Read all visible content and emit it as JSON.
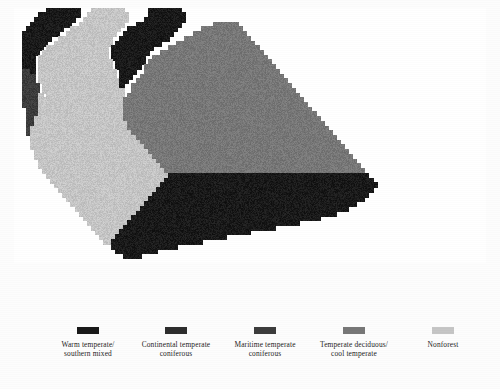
{
  "figure": {
    "kind": "raster-map",
    "region": "United States",
    "background_color": "#fdfdfd"
  },
  "chart_data": {
    "type": "heatmap",
    "title": "",
    "subtitle": "",
    "xlabel": "",
    "ylabel": "",
    "grid": false,
    "legend_position": "bottom",
    "classes": [
      {
        "id": "warm_temperate_southern_mixed",
        "label": "Warm temperate/\nsouthern mixed",
        "color": "#1a1a1a",
        "code": 1
      },
      {
        "id": "continental_temperate_coniferous",
        "label": "Continental temperate\nconiferous",
        "color": "#2e2e2e",
        "code": 2
      },
      {
        "id": "maritime_temperate_coniferous",
        "label": "Maritime temperate\nconiferous",
        "color": "#3d3d3d",
        "code": 3
      },
      {
        "id": "temperate_deciduous_cool_temperate",
        "label": "Temperate deciduous/\ncool temperate",
        "color": "#787878",
        "code": 4
      },
      {
        "id": "nonforest",
        "label": "Nonforest",
        "color": "#c6c6c6",
        "code": 5
      }
    ],
    "nodata_color": "#ffffff",
    "grid_cols": 118,
    "grid_rows": 64,
    "cell_px": 4,
    "values_note": "Each string row encodes one raster row; characters 0-5 map to class codes, 0 = background/no data (white ocean or outside USA).",
    "rows": [
      "00000000111111110005555555500000011111111000000000000000000000000000000000000000000000000000000000000000000000000000",
      "00000011111111110055555555550000011111111100000000000000000000000000000000000000000000000000000000000000000000000000",
      "00000111111111100555555555550000111111111100000000000000000000000000000000000000000000000000000000000000000000000000",
      "00001111111111005555555555500011111111111000000004444440000000000000000000000000000000000000000000000000000000000000",
      "00011111111100555555555555001111111111110000004444444444000000000000000000000000000000000000000000000000000000000000",
      "00111111111005555555555550011111111111100000444444444444400000000000000000000000000000000000000000000000000000000000",
      "00111111100555555555555500111111111111000044444444444444440000000000000000000000000000000000000000000000000000000000",
      "00111111005555555555555501111111111100004444444444444444444000000000000000000000000000000000000000000000000000000000",
      "00111110555555555555555011111111110000444444444444444444444400000000000000000000000000000000000000000000000000000000",
      "00111105555555555555555011111111100044444444444444444444444440000000000000000000000000000000000000000000000000000000",
      "00111055555555555555555011111111004444444444444444444444444444000000000000000000000000000000000000000000000000000000",
      "00111055555555555555555501111111044444444444444444444444444444400000000000000000000000000000000000000000000000000000",
      "00111055555555555555555501111110444444444444444444444444444444440000000000000000000000000000000000000000000000000000",
      "00331055555555555555555550111100444444444444444444444444444444444000000000000000000000000000000000000000000000000000",
      "00333055555555555555555550111004444444444444444444444444444444444400000000000000000000000000000000000000000000000000",
      "00333055555555555555555555110044444444444444444444444444444444444440000000000000000000000000000000000000000000000000",
      "00333305555555555555555555100444444444444444444444444444444444444444000000000000000000000000000000000000000000000000",
      "00333305555555555555555555500444444444444444444444444444444444444444400000000000000000000000000000000000000000000000",
      "00333350555555555555555555504444444444444444444444444444444444444444440000000000000000000000000000000000000000000000",
      "00333355555555555555555555544444444444444444444444444444444444444444444000000000000000000000000000000000000000000000",
      "00333355555555555555555555544444444444444444444444444444444444444444444400000000000000000000000000000000000000000000",
      "00033355555555555555555555544444444444444444444444444444444444444444444440000000000000000000000000000000000000000000",
      "00033355555555555555555555544444444444444444444444444444444444444444444444000000000000000000000000000000000000000000",
      "00033555555555555555555555544444444444444444444444444444444444444444444444400000000000000000000000000000000000000000",
      "00033555555555555555555555554444444444444444444444444444444444444444444444440000000000000000000000000000000000000000",
      "00035555555555555555555555554444444444444444444444444444444444444444444444444000000000000000000000000000000000000000",
      "00035555555555555555555555555444444444444444444444444444444444444444444444444400000000000000000000000000000000000000",
      "00005555555555555555555555555544444444444444444444444444444444444444444444444440000000000000000000000000000000000000",
      "00005555555555555555555555555554444444444444444444444444444444444444444444444444000000000000000000000000000000000000",
      "00005555555555555555555555555555444444444444444444444444444444444444444444444444400000000000000000000000000000000000",
      "00000555555555555555555555555555544444444444444444444444444444444444444444444444440000000000000000000000000000000000",
      "00000555555555555555555555555555554444444444444444444444444444444444444444444444444000000000000000000000000000000000",
      "00000055555555555555555555555555555444444444444444444444444444444444444444444444444400000000000000000000000000000000",
      "00000055555555555555555555555555555544444444444444444444444444444444444444444444444440000000000000000000000000000000",
      "00000005555555555555555555555555555554444444444444444444444444444444444444444444444444000000000000000000000000000000",
      "00000000555555555555555555555555555555111111111111111111111111111111111111111111111111100000000000000000000000000000",
      "00000000055555555555555555555555555551111111111111111111111111111111111111111111111111110000000000000000000000000000",
      "00000000005555555555555555555555555511111111111111111111111111111111111111111111111111111000000000000000000000000000",
      "00000000000555555555555555555555555111111111111111111111111111111111111111111111111111110000000000000000000000000000",
      "00000000000055555555555555555555551111111111111111111111111111111111111111111111111111100000000000000000000000000000",
      "00000000000005555555555555555555511111111111111111111111111111111111111111111111111111000000000000000000000000000000",
      "00000000000000555555555555555555111111111111111111111111111111111111111111111111111100000000000000000000000000000000",
      "00000000000000055555555555555551111111111111111111111111111111111111111111111111110000000000000000000000000000000000",
      "00000000000000005555555555555511111111111111111111111111111111111111111111111110000000000000000000000000000000000000",
      "00000000000000000555555555555111111111111111111111111111111111111111111111100000000000000000000000000000000000000000",
      "00000000000000000055555555551111111111111111111111111111111111111111110000000000000000000000000000000000000000000000",
      "00000000000000000005555555511111111111111111111111111111111111110000000000000000000000000000000000000000000000000000",
      "00000000000000000000555555111111111111111111111111111111110000000000000000000000000000000000000000000000000000000000",
      "00000000000000000000055551111111111111111111111111110000000000000000000000000000000000000000000000000000000000000000",
      "00000000000000000000005511111111111111111111110000000000000000000000000000000000000000000000000000000000000000000000",
      "00000000000000000000000011111111111111110000000000000000000000000000000000000000000000000000000000000000000000000000",
      "00000000000000000000000001111111111000000000000000000000000000000000000000000000000000000000000000000000000000000000",
      "00000000000000000000000000011110000000000000000000000000000000000000000000000000000000000000000000000000000000000000",
      "00000000000000000000000000000000000000000000000000000000000000000000000000000000000000000000000000000000000000000000"
    ]
  },
  "legend": {
    "items": [
      {
        "label": "Warm temperate/\nsouthern mixed",
        "color": "#1a1a1a"
      },
      {
        "label": "Continental temperate\nconiferous",
        "color": "#2e2e2e"
      },
      {
        "label": "Maritime temperate\nconiferous",
        "color": "#3d3d3d"
      },
      {
        "label": "Temperate deciduous/\ncool temperate",
        "color": "#787878"
      },
      {
        "label": "Nonforest",
        "color": "#c6c6c6"
      }
    ]
  }
}
